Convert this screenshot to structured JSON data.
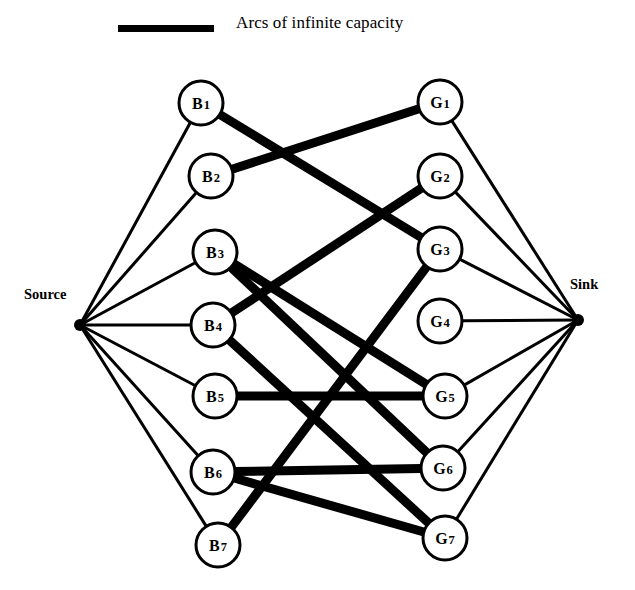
{
  "figure": {
    "background_color": "#ffffff",
    "ink_color": "#000000"
  },
  "legend": {
    "swatch_name": "thick-line-swatch",
    "label": "Arcs of infinite capacity",
    "swatch": {
      "x": 118,
      "y": 25,
      "width": 96,
      "height": 7
    }
  },
  "endpoints": {
    "source": {
      "label": "Source",
      "x": 80,
      "y": 325,
      "r": 6
    },
    "sink": {
      "label": "Sink",
      "x": 578,
      "y": 320,
      "r": 6
    }
  },
  "nodes": {
    "radius": 22,
    "left": [
      {
        "id": "B1",
        "prefix": "B",
        "index": "1",
        "x": 201,
        "y": 103
      },
      {
        "id": "B2",
        "prefix": "B",
        "index": "2",
        "x": 211,
        "y": 176
      },
      {
        "id": "B3",
        "prefix": "B",
        "index": "3",
        "x": 215,
        "y": 252
      },
      {
        "id": "B4",
        "prefix": "B",
        "index": "4",
        "x": 213,
        "y": 325
      },
      {
        "id": "B5",
        "prefix": "B",
        "index": "5",
        "x": 215,
        "y": 396
      },
      {
        "id": "B6",
        "prefix": "B",
        "index": "6",
        "x": 213,
        "y": 472
      },
      {
        "id": "B7",
        "prefix": "B",
        "index": "7",
        "x": 218,
        "y": 545
      }
    ],
    "right": [
      {
        "id": "G1",
        "prefix": "G",
        "index": "1",
        "x": 440,
        "y": 102
      },
      {
        "id": "G2",
        "prefix": "G",
        "index": "2",
        "x": 440,
        "y": 176
      },
      {
        "id": "G3",
        "prefix": "G",
        "index": "3",
        "x": 440,
        "y": 249
      },
      {
        "id": "G4",
        "prefix": "G",
        "index": "4",
        "x": 440,
        "y": 321
      },
      {
        "id": "G5",
        "prefix": "G",
        "index": "5",
        "x": 445,
        "y": 396
      },
      {
        "id": "G6",
        "prefix": "G",
        "index": "6",
        "x": 443,
        "y": 468
      },
      {
        "id": "G7",
        "prefix": "G",
        "index": "7",
        "x": 445,
        "y": 538
      }
    ]
  },
  "edges": {
    "thin_width": 3,
    "thick_width": 9,
    "source_arcs": [
      {
        "from": "Source",
        "to": "B1"
      },
      {
        "from": "Source",
        "to": "B2"
      },
      {
        "from": "Source",
        "to": "B3"
      },
      {
        "from": "Source",
        "to": "B4"
      },
      {
        "from": "Source",
        "to": "B5"
      },
      {
        "from": "Source",
        "to": "B6"
      },
      {
        "from": "Source",
        "to": "B7"
      }
    ],
    "sink_arcs": [
      {
        "from": "G1",
        "to": "Sink"
      },
      {
        "from": "G2",
        "to": "Sink"
      },
      {
        "from": "G3",
        "to": "Sink"
      },
      {
        "from": "G4",
        "to": "Sink"
      },
      {
        "from": "G5",
        "to": "Sink"
      },
      {
        "from": "G6",
        "to": "Sink"
      },
      {
        "from": "G7",
        "to": "Sink"
      }
    ],
    "infinite_capacity_arcs": [
      {
        "from": "B1",
        "to": "G3"
      },
      {
        "from": "B2",
        "to": "G1"
      },
      {
        "from": "B3",
        "to": "G6"
      },
      {
        "from": "B4",
        "to": "G7"
      },
      {
        "from": "B5",
        "to": "G5"
      },
      {
        "from": "B6",
        "to": "G6"
      },
      {
        "from": "B6",
        "to": "G7"
      },
      {
        "from": "B7",
        "to": "G3"
      },
      {
        "from": "B3",
        "to": "G5"
      },
      {
        "from": "B4",
        "to": "G2"
      }
    ]
  },
  "chart_data": {
    "type": "diagram",
    "subtype": "bipartite-flow-network",
    "title": "Arcs of infinite capacity",
    "left_set": [
      "B1",
      "B2",
      "B3",
      "B4",
      "B5",
      "B6",
      "B7"
    ],
    "right_set": [
      "G1",
      "G2",
      "G3",
      "G4",
      "G5",
      "G6",
      "G7"
    ],
    "terminals": [
      "Source",
      "Sink"
    ],
    "matching_arcs": [
      [
        "B1",
        "G3"
      ],
      [
        "B2",
        "G1"
      ],
      [
        "B3",
        "G6"
      ],
      [
        "B4",
        "G7"
      ],
      [
        "B5",
        "G5"
      ],
      [
        "B6",
        "G6"
      ],
      [
        "B6",
        "G7"
      ],
      [
        "B7",
        "G3"
      ],
      [
        "B3",
        "G5"
      ],
      [
        "B4",
        "G2"
      ]
    ]
  }
}
